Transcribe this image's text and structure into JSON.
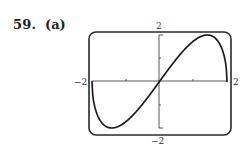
{
  "problem": {
    "number": "59.",
    "part": "(a)"
  },
  "chart_data": {
    "type": "line",
    "title": "",
    "function": "y = x*sqrt(4 - x^2)",
    "xlabel": "",
    "ylabel": "",
    "xlim": [
      -2,
      2
    ],
    "ylim": [
      -2,
      2
    ],
    "x_ticks": [
      -1,
      0,
      1
    ],
    "y_ticks": [
      -1,
      0,
      1
    ],
    "grid": false,
    "legend": null,
    "frame": "rounded viewing rectangle",
    "axis_labels": {
      "x_min": "−2",
      "x_max": "2",
      "y_min": "−2",
      "y_max": "2"
    },
    "series": [
      {
        "name": "f(x)",
        "x": [
          -2,
          -1.9,
          -1.75,
          -1.5,
          -1.414,
          -1.25,
          -1,
          -0.75,
          -0.5,
          -0.25,
          0,
          0.25,
          0.5,
          0.75,
          1,
          1.25,
          1.414,
          1.5,
          1.75,
          1.9,
          2
        ],
        "values": [
          0,
          -1.19,
          -1.69,
          -1.98,
          -2.0,
          -1.95,
          -1.73,
          -1.39,
          -0.97,
          -0.5,
          0,
          0.5,
          0.97,
          1.39,
          1.73,
          1.95,
          2.0,
          1.98,
          1.69,
          1.19,
          0
        ]
      }
    ],
    "colors": {
      "curve": "#1a1a1a",
      "axes": "#444444",
      "frame": "#2a2a2a"
    }
  }
}
